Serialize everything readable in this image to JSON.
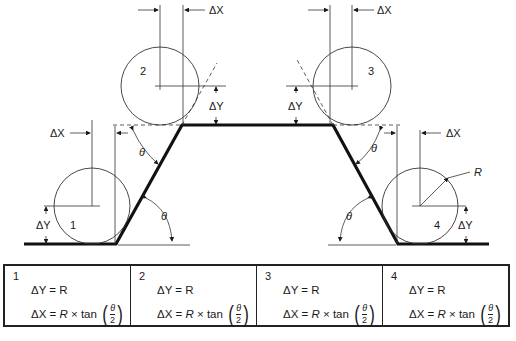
{
  "diagram": {
    "labels": {
      "delta_x": "ΔX",
      "delta_y": "ΔY",
      "theta": "θ",
      "radius": "R"
    },
    "circles": [
      {
        "id": "1",
        "label": "1"
      },
      {
        "id": "2",
        "label": "2"
      },
      {
        "id": "3",
        "label": "3"
      },
      {
        "id": "4",
        "label": "4"
      }
    ]
  },
  "table": {
    "cells": [
      {
        "num": "1",
        "eq_dy": "ΔY = R",
        "eq_dx_prefix": "ΔX = ",
        "eq_dx_r": "R",
        "eq_dx_mid": " × tan ",
        "frac_top": "θ",
        "frac_bot": "2"
      },
      {
        "num": "2",
        "eq_dy": "ΔY = R",
        "eq_dx_prefix": "ΔX = ",
        "eq_dx_r": "R",
        "eq_dx_mid": " × tan ",
        "frac_top": "θ",
        "frac_bot": "2"
      },
      {
        "num": "3",
        "eq_dy": "ΔY = R",
        "eq_dx_prefix": "ΔX = ",
        "eq_dx_r": "R",
        "eq_dx_mid": " × tan ",
        "frac_top": "θ",
        "frac_bot": "2"
      },
      {
        "num": "4",
        "eq_dy": "ΔY = R",
        "eq_dx_prefix": "ΔX = ",
        "eq_dx_r": "R",
        "eq_dx_mid": " × tan ",
        "frac_top": "θ",
        "frac_bot": "2"
      }
    ],
    "paren_open": "(",
    "paren_close": ")"
  }
}
